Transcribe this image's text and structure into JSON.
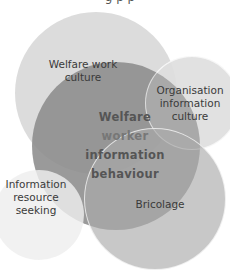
{
  "title_cut": "g      p   p",
  "circles": {
    "welfare_work_culture": {
      "label": "Welfare work\nculture",
      "color": "#dcdcdc"
    },
    "organisation_information_culture": {
      "label": "Organisation\ninformation\nculture",
      "color": "#ececec"
    },
    "center": {
      "label_lines": [
        "Welfare",
        "worker",
        "information",
        "behaviour"
      ],
      "color": "#9a9a9a"
    },
    "information_resource_seeking": {
      "label": "Information\nresource\nseeking",
      "color": "#ededed"
    },
    "bricolage": {
      "label": "Bricolage",
      "color": "#b0b0b0"
    }
  }
}
